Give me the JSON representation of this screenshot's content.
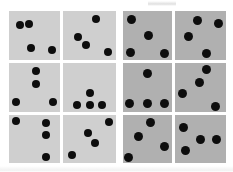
{
  "figure": {
    "name": "dot-pattern-panel-grid",
    "rows": 3,
    "columns": 4,
    "dots_per_panel": 4,
    "background_color": "#ffffff",
    "panel_color_left_group": "#cfcfcf",
    "panel_color_right_group": "#b0b0b0",
    "dot_color": "#0d0d0d"
  },
  "groups": [
    {
      "id": "left-group",
      "label": "",
      "shade": "light",
      "columns": [
        1,
        2
      ]
    },
    {
      "id": "right-group",
      "label": "",
      "shade": "dark",
      "columns": [
        3,
        4
      ]
    }
  ],
  "panels": [
    {
      "id": "panel-r1c1",
      "row": 1,
      "col": 1,
      "group": "left-group",
      "shade": "light",
      "x": 9,
      "y": 11,
      "w": 51,
      "h": 49,
      "dot_count": 4,
      "dots": [
        {
          "cx": 0.22,
          "cy": 0.28,
          "r": 0.085
        },
        {
          "cx": 0.4,
          "cy": 0.27,
          "r": 0.085
        },
        {
          "cx": 0.44,
          "cy": 0.76,
          "r": 0.085
        },
        {
          "cx": 0.85,
          "cy": 0.8,
          "r": 0.085
        }
      ]
    },
    {
      "id": "panel-r1c2",
      "row": 1,
      "col": 2,
      "group": "left-group",
      "shade": "light",
      "x": 63,
      "y": 11,
      "w": 53,
      "h": 49,
      "dot_count": 4,
      "dots": [
        {
          "cx": 0.62,
          "cy": 0.17,
          "r": 0.085
        },
        {
          "cx": 0.29,
          "cy": 0.53,
          "r": 0.085
        },
        {
          "cx": 0.44,
          "cy": 0.7,
          "r": 0.085
        },
        {
          "cx": 0.85,
          "cy": 0.84,
          "r": 0.085
        }
      ]
    },
    {
      "id": "panel-r1c3",
      "row": 1,
      "col": 3,
      "group": "right-group",
      "shade": "dark",
      "x": 123,
      "y": 11,
      "w": 49,
      "h": 49,
      "dot_count": 4,
      "dots": [
        {
          "cx": 0.17,
          "cy": 0.17,
          "r": 0.09
        },
        {
          "cx": 0.52,
          "cy": 0.5,
          "r": 0.09
        },
        {
          "cx": 0.15,
          "cy": 0.85,
          "r": 0.09
        },
        {
          "cx": 0.84,
          "cy": 0.87,
          "r": 0.09
        }
      ]
    },
    {
      "id": "panel-r1c4",
      "row": 1,
      "col": 4,
      "group": "right-group",
      "shade": "dark",
      "x": 175,
      "y": 11,
      "w": 51,
      "h": 49,
      "dot_count": 4,
      "dots": [
        {
          "cx": 0.44,
          "cy": 0.2,
          "r": 0.09
        },
        {
          "cx": 0.86,
          "cy": 0.26,
          "r": 0.09
        },
        {
          "cx": 0.26,
          "cy": 0.52,
          "r": 0.09
        },
        {
          "cx": 0.62,
          "cy": 0.86,
          "r": 0.09
        }
      ]
    },
    {
      "id": "panel-r2c1",
      "row": 2,
      "col": 1,
      "group": "left-group",
      "shade": "light",
      "x": 9,
      "y": 63,
      "w": 51,
      "h": 49,
      "dot_count": 4,
      "dots": [
        {
          "cx": 0.52,
          "cy": 0.17,
          "r": 0.085
        },
        {
          "cx": 0.52,
          "cy": 0.42,
          "r": 0.085
        },
        {
          "cx": 0.14,
          "cy": 0.8,
          "r": 0.085
        },
        {
          "cx": 0.87,
          "cy": 0.8,
          "r": 0.085
        }
      ]
    },
    {
      "id": "panel-r2c2",
      "row": 2,
      "col": 2,
      "group": "left-group",
      "shade": "light",
      "x": 63,
      "y": 63,
      "w": 53,
      "h": 49,
      "dot_count": 4,
      "dots": [
        {
          "cx": 0.51,
          "cy": 0.62,
          "r": 0.085
        },
        {
          "cx": 0.27,
          "cy": 0.85,
          "r": 0.085
        },
        {
          "cx": 0.51,
          "cy": 0.85,
          "r": 0.085
        },
        {
          "cx": 0.74,
          "cy": 0.85,
          "r": 0.085
        }
      ]
    },
    {
      "id": "panel-r2c3",
      "row": 2,
      "col": 3,
      "group": "right-group",
      "shade": "dark",
      "x": 123,
      "y": 63,
      "w": 49,
      "h": 49,
      "dot_count": 4,
      "dots": [
        {
          "cx": 0.5,
          "cy": 0.22,
          "r": 0.09
        },
        {
          "cx": 0.14,
          "cy": 0.82,
          "r": 0.09
        },
        {
          "cx": 0.5,
          "cy": 0.82,
          "r": 0.09
        },
        {
          "cx": 0.84,
          "cy": 0.82,
          "r": 0.09
        }
      ]
    },
    {
      "id": "panel-r2c4",
      "row": 2,
      "col": 4,
      "group": "right-group",
      "shade": "dark",
      "x": 175,
      "y": 63,
      "w": 51,
      "h": 49,
      "dot_count": 4,
      "dots": [
        {
          "cx": 0.62,
          "cy": 0.13,
          "r": 0.09
        },
        {
          "cx": 0.49,
          "cy": 0.4,
          "r": 0.09
        },
        {
          "cx": 0.15,
          "cy": 0.62,
          "r": 0.09
        },
        {
          "cx": 0.8,
          "cy": 0.88,
          "r": 0.09
        }
      ]
    },
    {
      "id": "panel-r3c1",
      "row": 3,
      "col": 1,
      "group": "left-group",
      "shade": "light",
      "x": 9,
      "y": 115,
      "w": 51,
      "h": 48,
      "dot_count": 4,
      "dots": [
        {
          "cx": 0.13,
          "cy": 0.13,
          "r": 0.085
        },
        {
          "cx": 0.72,
          "cy": 0.17,
          "r": 0.085
        },
        {
          "cx": 0.72,
          "cy": 0.42,
          "r": 0.085
        },
        {
          "cx": 0.72,
          "cy": 0.87,
          "r": 0.085
        }
      ]
    },
    {
      "id": "panel-r3c2",
      "row": 3,
      "col": 2,
      "group": "left-group",
      "shade": "light",
      "x": 63,
      "y": 115,
      "w": 53,
      "h": 48,
      "dot_count": 4,
      "dots": [
        {
          "cx": 0.87,
          "cy": 0.14,
          "r": 0.085
        },
        {
          "cx": 0.47,
          "cy": 0.38,
          "r": 0.085
        },
        {
          "cx": 0.6,
          "cy": 0.58,
          "r": 0.085
        },
        {
          "cx": 0.17,
          "cy": 0.84,
          "r": 0.085
        }
      ]
    },
    {
      "id": "panel-r3c3",
      "row": 3,
      "col": 3,
      "group": "right-group",
      "shade": "dark",
      "x": 123,
      "y": 115,
      "w": 49,
      "h": 48,
      "dot_count": 4,
      "dots": [
        {
          "cx": 0.57,
          "cy": 0.15,
          "r": 0.09
        },
        {
          "cx": 0.32,
          "cy": 0.44,
          "r": 0.09
        },
        {
          "cx": 0.84,
          "cy": 0.66,
          "r": 0.09
        },
        {
          "cx": 0.12,
          "cy": 0.88,
          "r": 0.09
        }
      ]
    },
    {
      "id": "panel-r3c4",
      "row": 3,
      "col": 4,
      "group": "right-group",
      "shade": "dark",
      "x": 175,
      "y": 115,
      "w": 51,
      "h": 48,
      "dot_count": 4,
      "dots": [
        {
          "cx": 0.17,
          "cy": 0.26,
          "r": 0.09
        },
        {
          "cx": 0.5,
          "cy": 0.52,
          "r": 0.09
        },
        {
          "cx": 0.81,
          "cy": 0.52,
          "r": 0.09
        },
        {
          "cx": 0.2,
          "cy": 0.74,
          "r": 0.09
        }
      ]
    }
  ]
}
